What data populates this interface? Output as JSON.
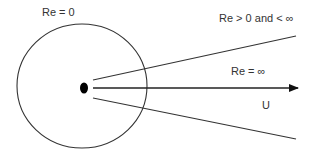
{
  "diagram": {
    "labels": {
      "re_zero": "Re = 0",
      "re_intermediate": "Re > 0 and < ∞",
      "re_infinite": "Re = ∞",
      "velocity": "U"
    },
    "colors": {
      "stroke": "#333333",
      "dot": "#000000",
      "background": "#ffffff"
    },
    "shapes": {
      "circle": {
        "cx": 82,
        "cy": 86,
        "rx": 65,
        "ry": 62
      },
      "source_dot": {
        "cx": 84,
        "cy": 88,
        "rx": 4,
        "ry": 5.5
      },
      "upper_line": {
        "x1": 93,
        "y1": 80,
        "x2": 296,
        "y2": 36
      },
      "center_arrow": {
        "x1": 93,
        "y1": 88,
        "x2": 298,
        "y2": 88
      },
      "lower_line": {
        "x1": 93,
        "y1": 98,
        "x2": 296,
        "y2": 139
      }
    }
  }
}
